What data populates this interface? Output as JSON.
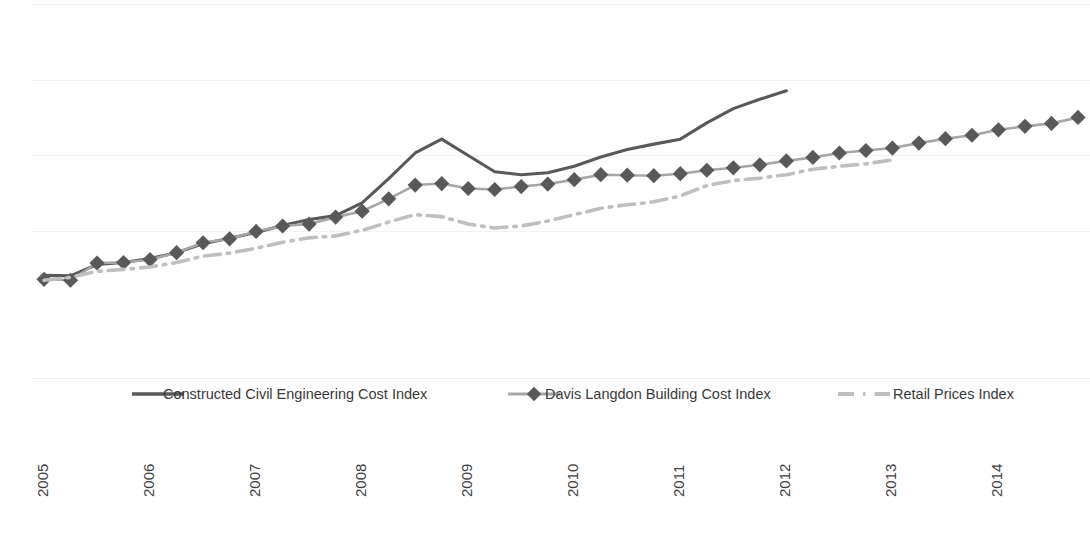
{
  "chart_data": {
    "type": "line",
    "title": "",
    "subtitle": "",
    "xlabel": "",
    "ylabel": "",
    "grid": true,
    "gridlines_y": [
      4,
      80,
      155,
      231
    ],
    "legend_position": "bottom",
    "xlim": [
      2005.0,
      2014.75
    ],
    "ylim": [
      95,
      155
    ],
    "x_tick_labels": [
      "2005",
      "2006",
      "2007",
      "2008",
      "2009",
      "2010",
      "2011",
      "2012",
      "2013",
      "2014"
    ],
    "x_tick_rotation": -90,
    "x": [
      2005.0,
      2005.25,
      2005.5,
      2005.75,
      2006.0,
      2006.25,
      2006.5,
      2006.75,
      2007.0,
      2007.25,
      2007.5,
      2007.75,
      2008.0,
      2008.25,
      2008.5,
      2008.75,
      2009.0,
      2009.25,
      2009.5,
      2009.75,
      2010.0,
      2010.25,
      2010.5,
      2010.75,
      2011.0,
      2011.25,
      2011.5,
      2011.75,
      2012.0,
      2012.25,
      2012.5,
      2012.75,
      2013.0,
      2013.25,
      2013.5,
      2013.75,
      2014.0,
      2014.25,
      2014.5,
      2014.75
    ],
    "series": [
      {
        "name": "Constructed Civil Engineering Cost Index",
        "style": "solid",
        "color": "#595959",
        "marker": "none",
        "values": [
          100.0,
          99.9,
          102.2,
          102.6,
          103.4,
          104.6,
          106.4,
          107.5,
          108.7,
          110.1,
          111.3,
          112.1,
          114.7,
          119.6,
          124.8,
          127.6,
          124.3,
          121.0,
          120.4,
          120.8,
          122.1,
          124.0,
          125.5,
          126.6,
          127.6,
          130.9,
          133.8,
          135.7,
          137.4,
          null,
          null,
          null,
          null,
          null,
          null,
          null,
          null,
          null,
          null,
          null
        ]
      },
      {
        "name": "Davis Langdon Building Cost Index",
        "style": "solid",
        "color": "#595959",
        "line_color": "#a6a6a6",
        "marker": "diamond",
        "values": [
          99.2,
          99.0,
          102.5,
          102.6,
          103.2,
          104.6,
          106.6,
          107.4,
          108.9,
          110.0,
          110.4,
          111.8,
          113.0,
          115.5,
          118.3,
          118.6,
          117.6,
          117.4,
          118.0,
          118.5,
          119.4,
          120.4,
          120.3,
          120.2,
          120.6,
          121.3,
          121.8,
          122.4,
          123.2,
          123.9,
          124.8,
          125.3,
          125.8,
          126.8,
          127.7,
          128.4,
          129.5,
          130.2,
          130.8,
          132.0
        ]
      },
      {
        "name": "Retail Prices Index",
        "style": "dash-dot",
        "color": "#bfbfbf",
        "marker": "none",
        "values": [
          99.0,
          99.6,
          100.8,
          101.2,
          101.7,
          102.6,
          103.9,
          104.5,
          105.5,
          106.7,
          107.6,
          108.0,
          109.1,
          110.8,
          112.3,
          111.9,
          110.4,
          109.6,
          110.0,
          111.0,
          112.3,
          113.6,
          114.3,
          114.9,
          116.1,
          118.2,
          119.2,
          119.7,
          120.4,
          121.5,
          122.1,
          122.6,
          123.4,
          null,
          null,
          null,
          null,
          null,
          null,
          null
        ]
      }
    ],
    "legend": [
      {
        "label": "Constructed Civil Engineering Cost Index",
        "color": "#595959",
        "style": "solid",
        "marker": "none"
      },
      {
        "label": "Davis Langdon Building Cost Index",
        "color": "#595959",
        "style": "solid",
        "marker": "diamond"
      },
      {
        "label": "Retail Prices Index",
        "color": "#bfbfbf",
        "style": "dash-dot",
        "marker": "none"
      }
    ]
  },
  "colors": {
    "background": "#ffffff",
    "gridline": "#f2f2f2",
    "dark_series": "#595959",
    "mid_series": "#a6a6a6",
    "light_series": "#bfbfbf",
    "tick_text": "#3f3f3f"
  }
}
